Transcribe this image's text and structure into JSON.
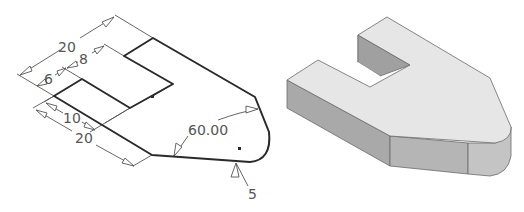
{
  "sketch": {
    "dimensions": {
      "overall_length": "20",
      "slot_depth": "8",
      "lip_width": "6",
      "slot_width": "10",
      "lower_length": "20",
      "taper_angle": "60.00",
      "fillet_radius": "5"
    }
  },
  "solid": {
    "colors": {
      "top_face": "#e6e6e6",
      "side_face": "#a8a8a8",
      "front_face": "#b8b8b8",
      "edge": "#6a6a6a"
    }
  },
  "colors": {
    "background": "#ffffff",
    "profile_line": "#2a2a2a",
    "dimension_line": "#555555"
  }
}
